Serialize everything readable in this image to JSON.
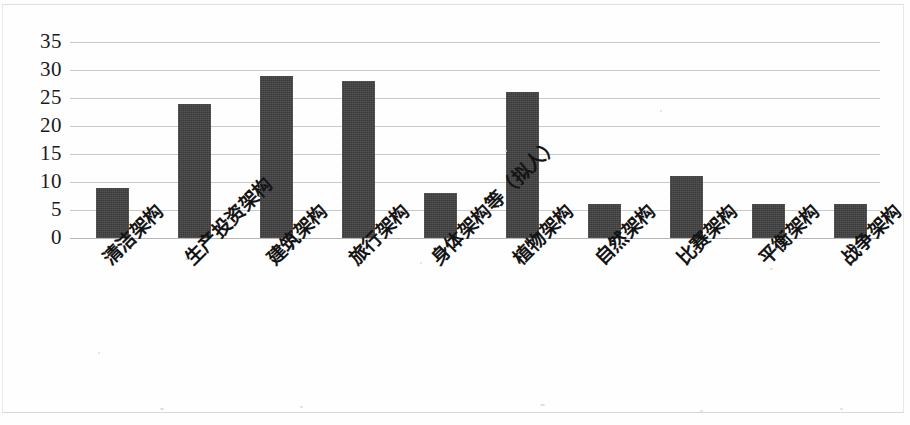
{
  "chart_data": {
    "type": "bar",
    "title": "",
    "xlabel": "",
    "ylabel": "",
    "ylim": [
      0,
      35
    ],
    "ytick_step": 5,
    "yticks": [
      "35",
      "30",
      "25",
      "20",
      "15",
      "10",
      "5",
      "0"
    ],
    "grid": true,
    "legend": "none",
    "bar_color": "#3a3a3a",
    "gridline_color": "#c9c9c9",
    "categories": [
      "清洁架构",
      "生产投资架构",
      "建筑架构",
      "旅行架构",
      "身体架构等（拟人）",
      "植物架构",
      "自然架构",
      "比赛架构",
      "平衡架构",
      "战争架构"
    ],
    "values": [
      9,
      24,
      29,
      28,
      8,
      26,
      6,
      11,
      6,
      6
    ]
  }
}
